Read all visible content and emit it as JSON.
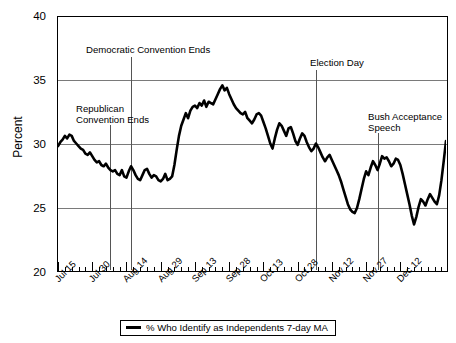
{
  "chart_data": {
    "type": "line",
    "title": "",
    "xlabel": "",
    "ylabel": "Percent",
    "ylim": [
      20,
      40
    ],
    "yticks": [
      20,
      25,
      30,
      35,
      40
    ],
    "grid": true,
    "legend_position": "bottom",
    "legend": [
      "% Who Identify as Independents 7-day MA"
    ],
    "series_name": "% Who Identify as Independents 7-day MA",
    "series_color": "#000000",
    "xticks": [
      "Jul 15",
      "Jul 30",
      "Aug 14",
      "Aug 29",
      "Sep 13",
      "Sep 28",
      "Oct 13",
      "Oct 28",
      "Nov 12",
      "Nov 27",
      "Dec 12"
    ],
    "xtick_index": [
      0,
      15,
      30,
      45,
      60,
      75,
      90,
      105,
      120,
      135,
      150
    ],
    "x_start_label": "Jul 15",
    "x_end_label": "Dec 22",
    "n_points": 161,
    "annotations": [
      {
        "label": "Republican\nConvention Ends",
        "x_index": 23,
        "value_note": "vertical marker near Aug 7"
      },
      {
        "label": "Democratic Convention Ends",
        "x_index": 32,
        "value_note": "vertical marker near Aug 16"
      },
      {
        "label": "Election Day",
        "x_index": 113,
        "value_note": "vertical marker near Nov 5"
      },
      {
        "label": "Bush Acceptance\nSpeech",
        "x_index": 140,
        "value_note": "vertical marker near Dec 2"
      }
    ],
    "values": [
      29.8,
      30.1,
      30.3,
      30.6,
      30.4,
      30.7,
      30.6,
      30.2,
      30.0,
      29.8,
      29.6,
      29.5,
      29.2,
      29.1,
      29.3,
      29.0,
      28.7,
      28.5,
      28.6,
      28.3,
      28.2,
      28.4,
      28.1,
      27.9,
      27.8,
      27.9,
      27.6,
      27.5,
      27.9,
      27.4,
      27.3,
      27.8,
      28.2,
      27.9,
      27.5,
      27.2,
      27.1,
      27.5,
      27.9,
      28.0,
      27.6,
      27.3,
      27.5,
      27.4,
      27.1,
      27.0,
      27.2,
      27.6,
      27.1,
      27.2,
      27.4,
      28.3,
      29.5,
      30.6,
      31.4,
      31.9,
      32.4,
      32.0,
      32.6,
      32.9,
      33.0,
      32.8,
      33.2,
      33.0,
      33.4,
      32.9,
      33.3,
      33.2,
      33.1,
      33.5,
      33.9,
      34.3,
      34.6,
      34.2,
      34.4,
      33.9,
      33.5,
      33.1,
      32.8,
      32.6,
      32.4,
      32.3,
      32.5,
      32.0,
      31.8,
      31.6,
      31.9,
      32.3,
      32.4,
      32.2,
      31.7,
      31.2,
      30.6,
      30.0,
      29.6,
      30.4,
      31.1,
      31.6,
      31.4,
      31.0,
      30.6,
      31.2,
      31.3,
      30.8,
      30.2,
      29.9,
      30.4,
      30.8,
      30.6,
      30.1,
      29.7,
      29.4,
      29.6,
      30.0,
      29.7,
      29.3,
      28.9,
      28.6,
      28.9,
      29.1,
      28.7,
      28.3,
      27.9,
      27.5,
      27.0,
      26.4,
      25.8,
      25.2,
      24.8,
      24.6,
      24.5,
      24.9,
      25.6,
      26.4,
      27.2,
      27.8,
      27.5,
      28.1,
      28.6,
      28.3,
      27.9,
      28.4,
      29.0,
      28.8,
      28.9,
      28.6,
      28.2,
      28.4,
      28.8,
      28.7,
      28.3,
      27.6,
      26.8,
      26.0,
      25.2,
      24.3,
      23.6,
      24.2,
      25.0,
      25.6,
      25.4,
      25.1,
      25.6,
      26.0,
      25.7,
      25.4,
      25.2,
      25.9,
      27.1,
      28.6,
      30.2
    ]
  },
  "legend": {
    "entry_label": "% Who Identify as Independents 7-day MA"
  },
  "axis": {
    "y_title": "Percent",
    "y_labels": [
      "40",
      "35",
      "30",
      "25",
      "20"
    ]
  },
  "annotations": {
    "republican_line1": "Republican",
    "republican_line2": "Convention Ends",
    "democratic": "Democratic Convention Ends",
    "election": "Election Day",
    "bush_line1": "Bush Acceptance",
    "bush_line2": "Speech"
  }
}
